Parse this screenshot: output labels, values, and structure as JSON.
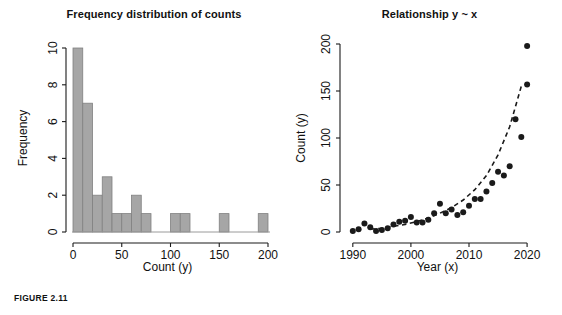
{
  "figure": {
    "caption": "FIGURE 2.11"
  },
  "panels": {
    "histogram": {
      "title": "Frequency distribution of counts",
      "xlabel": "Count (y)",
      "ylabel": "Frequency"
    },
    "scatter": {
      "title": "Relationship y ~ x",
      "xlabel": "Year (x)",
      "ylabel": "Count (y)"
    }
  },
  "chart_data": [
    {
      "type": "bar",
      "title": "Frequency distribution of counts",
      "xlabel": "Count (y)",
      "ylabel": "Frequency",
      "xlim": [
        0,
        200
      ],
      "ylim": [
        0,
        10
      ],
      "xticks": [
        0,
        50,
        100,
        150,
        200
      ],
      "xtick_labels": [
        "0",
        "50",
        "100",
        "150",
        "200"
      ],
      "yticks": [
        0,
        2,
        4,
        6,
        8,
        10
      ],
      "ytick_labels": [
        "0",
        "2",
        "4",
        "6",
        "8",
        "10"
      ],
      "grid": false,
      "legend": "none",
      "bin_width": 10,
      "bar_color": "#a6a6a6",
      "bar_edge_color": "#808080",
      "bin_starts": [
        0,
        10,
        20,
        30,
        40,
        50,
        60,
        70,
        80,
        90,
        100,
        110,
        120,
        130,
        140,
        150,
        160,
        170,
        180,
        190
      ],
      "categories": [
        "0-10",
        "10-20",
        "20-30",
        "30-40",
        "40-50",
        "50-60",
        "60-70",
        "70-80",
        "80-90",
        "90-100",
        "100-110",
        "110-120",
        "120-130",
        "130-140",
        "140-150",
        "150-160",
        "160-170",
        "170-180",
        "180-190",
        "190-200"
      ],
      "values": [
        10,
        7,
        2,
        3,
        1,
        1,
        2,
        1,
        0,
        0,
        1,
        1,
        0,
        0,
        0,
        1,
        0,
        0,
        0,
        1
      ]
    },
    {
      "type": "scatter",
      "title": "Relationship y ~ x",
      "xlabel": "Year (x)",
      "ylabel": "Count (y)",
      "xlim": [
        1989,
        2020.5
      ],
      "ylim": [
        0,
        200
      ],
      "xticks": [
        1990,
        2000,
        2010,
        2020
      ],
      "xtick_labels": [
        "1990",
        "2000",
        "2010",
        "2020"
      ],
      "yticks": [
        0,
        50,
        100,
        150,
        200
      ],
      "ytick_labels": [
        "0",
        "50",
        "100",
        "150",
        "200"
      ],
      "grid": false,
      "legend": "none",
      "point_color": "#1a1a1a",
      "point_shape": "filled-circle",
      "fit_line_style": "dashed",
      "fit_line_color": "#1a1a1a",
      "x": [
        1990,
        1991,
        1992,
        1993,
        1994,
        1995,
        1996,
        1997,
        1998,
        1999,
        2000,
        2001,
        2002,
        2003,
        2004,
        2005,
        2006,
        2007,
        2008,
        2009,
        2010,
        2011,
        2012,
        2013,
        2014,
        2015,
        2016,
        2017,
        2018,
        2019,
        2020
      ],
      "y": [
        1,
        3,
        9,
        5,
        1,
        2,
        4,
        8,
        11,
        12,
        16,
        10,
        10,
        13,
        20,
        30,
        20,
        24,
        18,
        21,
        28,
        35,
        35,
        43,
        52,
        64,
        60,
        70,
        120,
        101,
        157
      ],
      "extra_points": [
        {
          "x": 2020,
          "y": 198
        }
      ],
      "fit_curve_note": "dashed exponential trend line through the points",
      "fit_curve": {
        "x": [
          1993,
          1995,
          1997,
          1999,
          2001,
          2003,
          2005,
          2007,
          2009,
          2011,
          2013,
          2015,
          2017,
          2019
        ],
        "y": [
          3,
          4,
          6,
          8,
          11,
          15,
          20,
          26,
          34,
          45,
          60,
          82,
          112,
          155
        ]
      }
    }
  ]
}
